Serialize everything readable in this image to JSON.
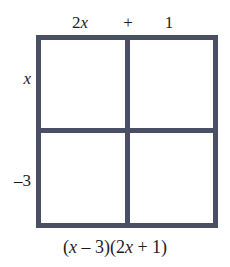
{
  "figure": {
    "type": "area-model-box",
    "title": "",
    "grid": {
      "rows": 2,
      "columns": 2,
      "border_color": "#4a4f63",
      "cell_fill": "#ffffff",
      "cells": [
        {
          "id": "top-left",
          "text": ""
        },
        {
          "id": "top-right",
          "text": ""
        },
        {
          "id": "bottom-left",
          "text": ""
        },
        {
          "id": "bottom-right",
          "text": ""
        }
      ]
    },
    "column_labels": [
      {
        "id": "col-term-1",
        "text": "2x",
        "italic_part": "x"
      },
      {
        "id": "col-operator",
        "text": "+"
      },
      {
        "id": "col-term-2",
        "text": "1"
      }
    ],
    "row_labels": [
      {
        "id": "row-term-1",
        "text": "x",
        "italic_part": "x"
      },
      {
        "id": "row-term-2",
        "text": "–3"
      }
    ],
    "caption": "(x – 3)(2x + 1)",
    "caption_parts": {
      "open_1": "(",
      "var_1": "x",
      "op_1": " – ",
      "num_1": "3",
      "close_1": ")",
      "open_2": "(",
      "num_2": "2",
      "var_2": "x",
      "op_2": " + ",
      "num_3": "1",
      "close_2": ")"
    }
  }
}
